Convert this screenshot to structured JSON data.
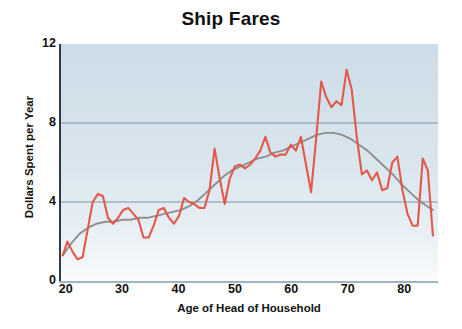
{
  "chart_data": {
    "type": "line",
    "title": "Ship Fares",
    "xlabel": "Age of Head of Household",
    "ylabel": "Dollars Spent per Year",
    "xlim": [
      19,
      86
    ],
    "ylim": [
      0,
      12
    ],
    "xticks": [
      20,
      30,
      40,
      50,
      60,
      70,
      80
    ],
    "yticks": [
      0,
      4,
      8,
      12
    ],
    "gridlines": {
      "y": [
        4,
        8
      ],
      "x": []
    },
    "legend": null,
    "series": [
      {
        "name": "Dollars Spent per Year",
        "type": "line",
        "color": "#e4584a",
        "x": [
          19.5,
          20.3,
          21.2,
          22.1,
          23.0,
          23.9,
          24.8,
          25.7,
          26.6,
          27.5,
          28.4,
          29.3,
          30.2,
          31.1,
          32.0,
          32.9,
          33.8,
          34.7,
          35.6,
          36.5,
          37.4,
          38.3,
          39.2,
          40.1,
          41.0,
          41.9,
          42.8,
          43.7,
          44.6,
          45.5,
          46.4,
          47.3,
          48.2,
          49.1,
          50.0,
          50.9,
          51.8,
          52.7,
          53.6,
          54.5,
          55.4,
          56.3,
          57.2,
          58.1,
          59.0,
          59.9,
          60.8,
          61.7,
          62.6,
          63.5,
          64.4,
          65.3,
          66.2,
          67.1,
          68.0,
          68.9,
          69.8,
          70.7,
          71.6,
          72.5,
          73.4,
          74.3,
          75.2,
          76.1,
          77.0,
          77.9,
          78.8,
          79.7,
          80.6,
          81.5,
          82.4,
          83.3,
          84.2,
          85.1
        ],
        "y": [
          1.3,
          2.0,
          1.5,
          1.1,
          1.2,
          2.6,
          4.0,
          4.4,
          4.3,
          3.2,
          2.9,
          3.2,
          3.6,
          3.7,
          3.4,
          3.1,
          2.2,
          2.2,
          2.8,
          3.6,
          3.7,
          3.2,
          2.9,
          3.3,
          4.2,
          4.0,
          3.9,
          3.7,
          3.7,
          4.6,
          6.7,
          5.2,
          3.9,
          5.2,
          5.8,
          5.9,
          5.7,
          5.9,
          6.2,
          6.6,
          7.3,
          6.5,
          6.3,
          6.4,
          6.4,
          6.9,
          6.6,
          7.3,
          5.9,
          4.5,
          7.2,
          10.1,
          9.3,
          8.8,
          9.1,
          8.9,
          10.7,
          9.7,
          7.3,
          5.4,
          5.6,
          5.1,
          5.5,
          4.6,
          4.7,
          6.0,
          6.3,
          4.6,
          3.4,
          2.8,
          2.8,
          6.2,
          5.6,
          2.3
        ]
      },
      {
        "name": "Smoothed trend",
        "type": "line",
        "color": "#8f8f8f",
        "x": [
          19.5,
          21.0,
          22.5,
          24.0,
          25.5,
          27.0,
          28.5,
          30.0,
          31.5,
          33.0,
          34.5,
          36.0,
          37.5,
          39.0,
          40.5,
          42.0,
          43.5,
          45.0,
          46.5,
          48.0,
          49.5,
          51.0,
          52.5,
          54.0,
          55.5,
          57.0,
          58.5,
          60.0,
          61.5,
          63.0,
          64.5,
          66.0,
          67.5,
          69.0,
          70.5,
          72.0,
          73.5,
          75.0,
          76.5,
          78.0,
          79.5,
          81.0,
          82.5,
          84.0,
          85.1
        ],
        "y": [
          1.3,
          1.9,
          2.4,
          2.7,
          2.9,
          3.0,
          3.0,
          3.1,
          3.1,
          3.2,
          3.2,
          3.3,
          3.4,
          3.5,
          3.6,
          3.8,
          4.1,
          4.5,
          4.9,
          5.3,
          5.6,
          5.8,
          6.0,
          6.2,
          6.3,
          6.5,
          6.6,
          6.8,
          7.0,
          7.2,
          7.4,
          7.5,
          7.5,
          7.4,
          7.2,
          6.9,
          6.6,
          6.2,
          5.8,
          5.4,
          4.9,
          4.5,
          4.1,
          3.8,
          3.6
        ]
      }
    ]
  },
  "ticks": {
    "y": [
      "12",
      "8",
      "4",
      "0"
    ],
    "x": [
      "20",
      "30",
      "40",
      "50",
      "60",
      "70",
      "80"
    ]
  },
  "colors": {
    "data_line": "#e4584a",
    "trend_line": "#8f8f8f",
    "grid": "#7e93a3",
    "axis": "#333b42",
    "plot_bg_top": "#ccdce8",
    "plot_bg_bottom": "#fbfcfd",
    "text": "#111111"
  }
}
